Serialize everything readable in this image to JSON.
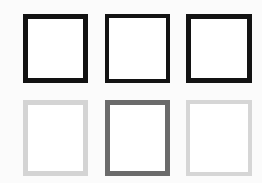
{
  "canvas": {
    "width": 262,
    "height": 183,
    "background_color": "#fbfbfb",
    "description": "Grid of six hollow square outlines, two rows by three columns"
  },
  "shapes": [
    {
      "id": "square-top-left",
      "row": 1,
      "column": 1,
      "shape": "square-outline",
      "border_color": "#121212",
      "fill_color": "#ffffff",
      "border_width": 5,
      "x": 23,
      "y": 14,
      "width": 65,
      "height": 69
    },
    {
      "id": "square-top-center",
      "row": 1,
      "column": 2,
      "shape": "square-outline",
      "border_color": "#131313",
      "fill_color": "#ffffff",
      "border_width": 4,
      "x": 105,
      "y": 14,
      "width": 65,
      "height": 69
    },
    {
      "id": "square-top-right",
      "row": 1,
      "column": 3,
      "shape": "square-outline",
      "border_color": "#131313",
      "fill_color": "#ffffff",
      "border_width": 5,
      "x": 186,
      "y": 14,
      "width": 66,
      "height": 69
    },
    {
      "id": "square-bottom-left",
      "row": 2,
      "column": 1,
      "shape": "square-outline",
      "border_color": "#d4d4d4",
      "fill_color": "#ffffff",
      "border_width": 5,
      "x": 23,
      "y": 100,
      "width": 65,
      "height": 76
    },
    {
      "id": "square-bottom-center",
      "row": 2,
      "column": 2,
      "shape": "square-outline",
      "border_color": "#6b6b6b",
      "fill_color": "#ffffff",
      "border_width": 5,
      "x": 105,
      "y": 100,
      "width": 65,
      "height": 76
    },
    {
      "id": "square-bottom-right",
      "row": 2,
      "column": 3,
      "shape": "square-outline",
      "border_color": "#d6d6d6",
      "fill_color": "#ffffff",
      "border_width": 4,
      "x": 186,
      "y": 100,
      "width": 66,
      "height": 76
    }
  ]
}
